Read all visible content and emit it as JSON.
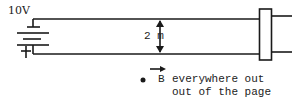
{
  "battery": {
    "label": "10V"
  },
  "separation": {
    "label": "2 m"
  },
  "field": {
    "symbol": "B",
    "line1": "everywhere out",
    "line2": "out of the page"
  },
  "colors": {
    "ink": "#1a1a1a"
  }
}
